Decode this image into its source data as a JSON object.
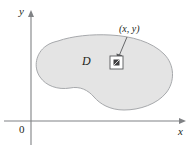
{
  "figure": {
    "type": "math-diagram",
    "background_color": "#ffffff"
  },
  "axes": {
    "x_label": "x",
    "y_label": "y",
    "origin_label": "0",
    "color": "#808285",
    "x_axis": {
      "y": 121,
      "x_start": 4,
      "x_end": 186,
      "arrow": "right"
    },
    "y_axis": {
      "x": 31,
      "y_start": 145,
      "y_end": 10,
      "arrow": "up"
    }
  },
  "region": {
    "label": "D",
    "fill_color": "#e4e4e4",
    "stroke_color": "#a7a9ac",
    "stroke_width": 1
  },
  "sample_point": {
    "label": "(x, y)",
    "marker": "square-area-element",
    "marker_stroke_color": "#58595b",
    "marker_fill_color": "#ffffff",
    "inner_patch_color": "#414042",
    "leader_line_color": "#58595b"
  }
}
